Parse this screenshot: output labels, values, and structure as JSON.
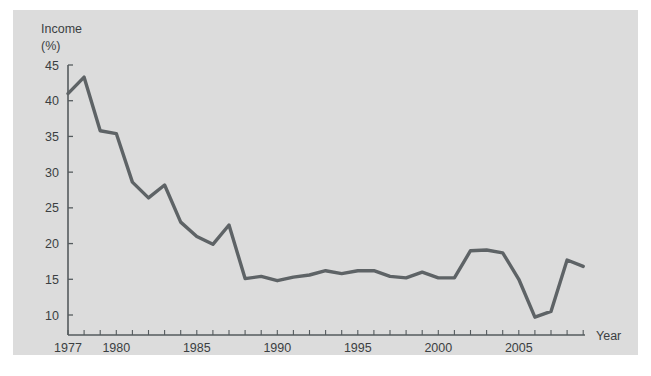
{
  "figure": {
    "background_color": "#ffffff",
    "panel_color": "#dcdcdc",
    "line_color": "#5e6366",
    "axis_color": "#555b5e",
    "text_color": "#3b3f42"
  },
  "labels": {
    "y_axis_title_line1": "Income",
    "y_axis_title_line2": "(%)",
    "x_axis_title": "Year"
  },
  "chart_data": {
    "type": "line",
    "title": "",
    "xlabel": "Year",
    "ylabel": "Income (%)",
    "xlim": [
      1977,
      2009
    ],
    "ylim": [
      7.5,
      45
    ],
    "grid": false,
    "legend": null,
    "y_ticks": [
      10,
      15,
      20,
      25,
      30,
      35,
      40,
      45
    ],
    "x_ticks": [
      1977,
      1978,
      1979,
      1980,
      1981,
      1982,
      1983,
      1984,
      1985,
      1986,
      1987,
      1988,
      1989,
      1990,
      1991,
      1992,
      1993,
      1994,
      1995,
      1996,
      1997,
      1998,
      1999,
      2000,
      2001,
      2002,
      2003,
      2004,
      2005,
      2006,
      2007,
      2008,
      2009
    ],
    "x_tick_labels_shown": [
      "1977",
      "1980",
      "1985",
      "1990",
      "1995",
      "2000",
      "2005"
    ],
    "x": [
      1977,
      1978,
      1979,
      1980,
      1981,
      1982,
      1983,
      1984,
      1985,
      1986,
      1987,
      1988,
      1989,
      1990,
      1991,
      1992,
      1993,
      1994,
      1995,
      1996,
      1997,
      1998,
      1999,
      2000,
      2001,
      2002,
      2003,
      2004,
      2005,
      2006,
      2007,
      2008,
      2009
    ],
    "values": [
      41.0,
      43.3,
      35.8,
      35.4,
      28.6,
      26.4,
      28.2,
      23.0,
      21.0,
      19.9,
      22.6,
      15.1,
      15.4,
      14.8,
      15.3,
      15.6,
      16.2,
      15.8,
      16.2,
      16.2,
      15.4,
      15.2,
      16.0,
      15.2,
      15.2,
      19.0,
      19.1,
      18.7,
      15.0,
      9.7,
      10.5,
      17.7,
      16.8
    ],
    "series": [
      {
        "name": "Income (%)",
        "values": [
          41.0,
          43.3,
          35.8,
          35.4,
          28.6,
          26.4,
          28.2,
          23.0,
          21.0,
          19.9,
          22.6,
          15.1,
          15.4,
          14.8,
          15.3,
          15.6,
          16.2,
          15.8,
          16.2,
          16.2,
          15.4,
          15.2,
          16.0,
          15.2,
          15.2,
          19.0,
          19.1,
          18.7,
          15.0,
          9.7,
          10.5,
          17.7,
          16.8
        ]
      }
    ]
  },
  "geometry": {
    "x_origin_px": 68,
    "x_step_px": 16.1,
    "y_45_px": 65,
    "y_10_px": 315,
    "axis_bottom_px": 335,
    "axis_right_px": 585
  }
}
